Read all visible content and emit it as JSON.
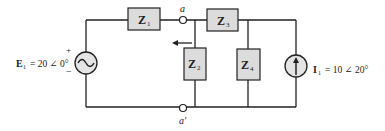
{
  "diagram": {
    "type": "circuit",
    "components": {
      "Z1": {
        "label": "Z",
        "sub": "1"
      },
      "Z2": {
        "label": "Z",
        "sub": "2"
      },
      "Z3": {
        "label": "Z",
        "sub": "3"
      },
      "Z4": {
        "label": "Z",
        "sub": "4"
      }
    },
    "voltage_source": {
      "name": "E",
      "sub": "1",
      "eq": "= 20 ∠ 0°",
      "plus": "+",
      "minus": "−"
    },
    "current_source": {
      "name": "I",
      "sub": "1",
      "eq": "= 10 ∠ 20°"
    },
    "nodes": {
      "a": "a",
      "a_prime": "a′"
    }
  }
}
